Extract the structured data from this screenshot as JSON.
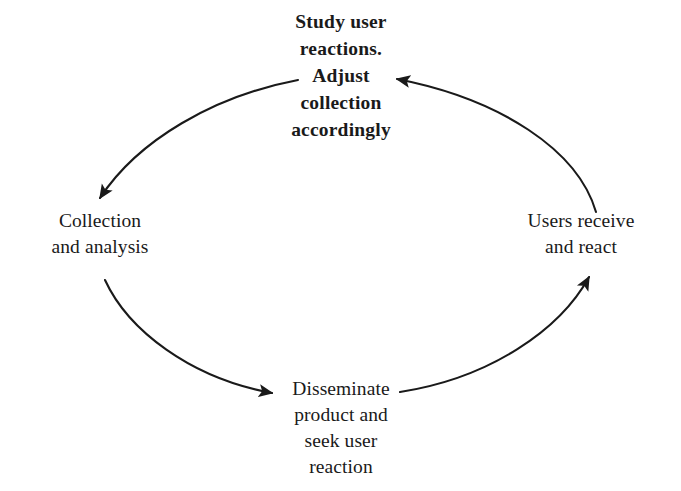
{
  "diagram": {
    "type": "cycle-diagram",
    "direction": "counter-clockwise",
    "line_color": "#1a1a1a",
    "text_color": "#1a1a1a",
    "background_color": "#ffffff",
    "nodes": [
      {
        "id": "study",
        "position": "top",
        "emphasis": "bold",
        "text": "Study user\nreactions.\nAdjust\ncollection\naccordingly"
      },
      {
        "id": "collection",
        "position": "left",
        "emphasis": "regular",
        "text": "Collection\nand analysis"
      },
      {
        "id": "disseminate",
        "position": "bottom",
        "emphasis": "regular",
        "text": "Disseminate\nproduct and\nseek user\nreaction"
      },
      {
        "id": "users",
        "position": "right",
        "emphasis": "regular",
        "text": "Users receive\nand react"
      }
    ],
    "arrows": [
      {
        "id": "study-to-collection",
        "from": "study",
        "to": "collection",
        "head_direction": "down-right"
      },
      {
        "id": "collection-to-disseminate",
        "from": "collection",
        "to": "disseminate",
        "head_direction": "right"
      },
      {
        "id": "disseminate-to-users",
        "from": "disseminate",
        "to": "users",
        "head_direction": "up-right"
      },
      {
        "id": "users-to-study",
        "from": "users",
        "to": "study",
        "head_direction": "left"
      }
    ]
  }
}
